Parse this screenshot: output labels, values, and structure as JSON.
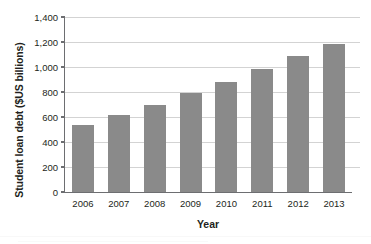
{
  "chart_data": {
    "type": "bar",
    "title": "",
    "xlabel": "Year",
    "ylabel": "Student loan debt ($US billions)",
    "categories": [
      "2006",
      "2007",
      "2008",
      "2009",
      "2010",
      "2011",
      "2012",
      "2013"
    ],
    "values": [
      535,
      615,
      695,
      795,
      880,
      985,
      1090,
      1185
    ],
    "ylim": [
      0,
      1400
    ],
    "ytick_values": [
      0,
      200,
      400,
      600,
      800,
      1000,
      1200,
      1400
    ],
    "ytick_labels": [
      "0",
      "200",
      "400",
      "600",
      "800",
      "1,000",
      "1,200",
      "1,400"
    ],
    "grid": "horizontal",
    "legend": "none",
    "bar_color": "#8a8a8a",
    "gridline_color": "#d3d3d3",
    "axis_color": "#6d6e71",
    "text_color": "#231f20"
  },
  "axes": {
    "y_title": "Student loan debt ($US billions)",
    "x_title": "Year"
  }
}
